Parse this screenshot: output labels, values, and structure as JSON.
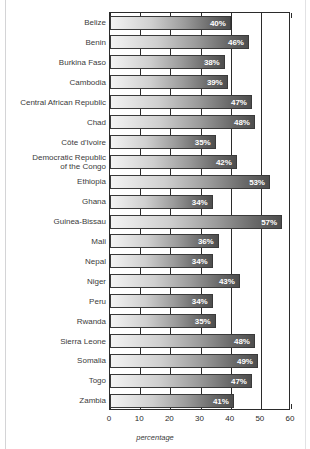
{
  "figure": {
    "frame_color": "#d4d4d6",
    "axis_color": "#2b2b2b",
    "bar_border_color": "#3a3a3a",
    "bar_gradient_light": "#f4f4f4",
    "bar_gradient_dark": "#4e4e4e",
    "value_label_color": "#ffffff",
    "category_label_color": "#3b3b3b"
  },
  "chart_data": {
    "type": "bar",
    "orientation": "horizontal",
    "title": "",
    "subtitle": "",
    "xlabel": "percentage",
    "ylabel": "",
    "xlim": [
      0,
      60
    ],
    "xticks": [
      0,
      10,
      20,
      30,
      40,
      50,
      60
    ],
    "xtick_labels": [
      "0",
      "10",
      "20",
      "30",
      "40",
      "50",
      "60"
    ],
    "grid": true,
    "grid_axis": "x",
    "legend": null,
    "value_label_suffix": "%",
    "categories": [
      "Belize",
      "Benin",
      "Burkina Faso",
      "Cambodia",
      "Central African Republic",
      "Chad",
      "Côte d'Ivoire",
      "Democratic Republic\nof the Congo",
      "Ethiopia",
      "Ghana",
      "Guinea-Bissau",
      "Mali",
      "Nepal",
      "Niger",
      "Peru",
      "Rwanda",
      "Sierra Leone",
      "Somalia",
      "Togo",
      "Zambia"
    ],
    "values": [
      40,
      46,
      38,
      39,
      47,
      48,
      35,
      42,
      53,
      34,
      57,
      36,
      34,
      43,
      34,
      35,
      48,
      49,
      47,
      41
    ],
    "value_labels": [
      "40%",
      "46%",
      "38%",
      "39%",
      "47%",
      "48%",
      "35%",
      "42%",
      "53%",
      "34%",
      "57%",
      "36%",
      "34%",
      "43%",
      "34%",
      "35%",
      "48%",
      "49%",
      "47%",
      "41%"
    ]
  }
}
